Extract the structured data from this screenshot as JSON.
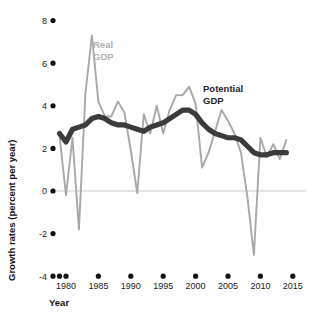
{
  "chart_data": {
    "type": "line",
    "title": "",
    "xlabel": "Year",
    "ylabel": "Growth rates (percent per year)",
    "xlim": [
      1979,
      2015
    ],
    "ylim": [
      -4,
      8
    ],
    "grid": false,
    "zero_line": true,
    "legend_position": "inline-annotations",
    "x_ticks": [
      "1980",
      "1985",
      "1990",
      "1995",
      "2000",
      "2005",
      "2010",
      "2015"
    ],
    "x_tick_values": [
      1980,
      1985,
      1990,
      1995,
      2000,
      2005,
      2010,
      2015
    ],
    "y_ticks": [
      "8",
      "6",
      "4",
      "2",
      "0",
      "-2",
      "-4"
    ],
    "y_tick_values": [
      8,
      6,
      4,
      2,
      0,
      -2,
      -4
    ],
    "x": [
      1979,
      1980,
      1981,
      1982,
      1983,
      1984,
      1985,
      1986,
      1987,
      1988,
      1989,
      1990,
      1991,
      1992,
      1993,
      1994,
      1995,
      1996,
      1997,
      1998,
      1999,
      2000,
      2001,
      2002,
      2003,
      2004,
      2005,
      2006,
      2007,
      2008,
      2009,
      2010,
      2011,
      2012,
      2013,
      2014
    ],
    "series": [
      {
        "name": "Real GDP",
        "color": "#a8a8a8",
        "label_x": 1985.6,
        "label_y": 6.6,
        "values": [
          2.6,
          -0.2,
          2.5,
          -1.8,
          4.6,
          7.3,
          4.2,
          3.5,
          3.5,
          4.2,
          3.7,
          1.9,
          -0.1,
          3.6,
          2.7,
          4.0,
          2.7,
          3.8,
          4.5,
          4.5,
          4.9,
          4.1,
          1.1,
          1.8,
          2.8,
          3.8,
          3.3,
          2.7,
          1.8,
          -0.3,
          -3.0,
          2.5,
          1.6,
          2.2,
          1.5,
          2.4
        ]
      },
      {
        "name": "Potential GDP",
        "color": "#3b3b3b",
        "label_x": 2002.2,
        "label_y": 4.6,
        "values": [
          2.7,
          2.3,
          2.9,
          3.0,
          3.1,
          3.4,
          3.5,
          3.4,
          3.2,
          3.1,
          3.1,
          3.0,
          2.9,
          2.8,
          3.0,
          3.1,
          3.2,
          3.4,
          3.6,
          3.8,
          3.8,
          3.6,
          3.2,
          2.9,
          2.7,
          2.6,
          2.5,
          2.5,
          2.4,
          2.1,
          1.8,
          1.7,
          1.7,
          1.8,
          1.8,
          1.8
        ]
      }
    ]
  },
  "axes": {
    "x_title": "Year",
    "y_title": "Growth rates (percent per year)"
  },
  "annotations": {
    "real_gdp_line1": "Real",
    "real_gdp_line2": "GDP",
    "potential_gdp_line1": "Potential",
    "potential_gdp_line2": "GDP"
  },
  "colors": {
    "real_gdp": "#a8a8a8",
    "potential_gdp": "#3b3b3b",
    "zero_line": "#c9c9c9",
    "tick_dot": "#111111",
    "background": "#ffffff"
  }
}
